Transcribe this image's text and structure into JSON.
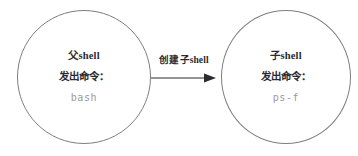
{
  "diagram": {
    "type": "process-flow",
    "background_color": "#ffffff",
    "stroke_color": "#7d7d85",
    "text_color": "#2b2b30",
    "command_text_color": "#9a9aa0",
    "nodes": [
      {
        "id": "parent-shell",
        "shape": "circle",
        "title": "父shell",
        "caption": "发出命令：",
        "command": "bash"
      },
      {
        "id": "child-shell",
        "shape": "circle",
        "title": "子shell",
        "caption": "发出命令：",
        "command": "ps-f"
      }
    ],
    "edges": [
      {
        "id": "create-child-shell",
        "from": "parent-shell",
        "to": "child-shell",
        "label": "创建子shell",
        "arrow": "single-head-right"
      }
    ]
  }
}
